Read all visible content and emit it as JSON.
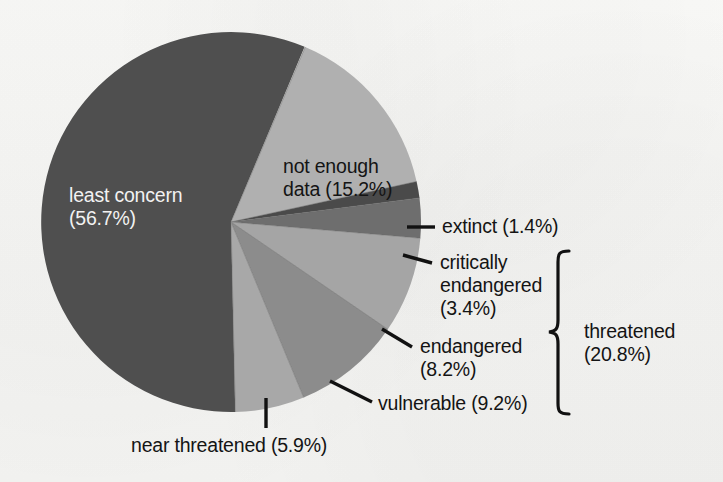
{
  "figure": {
    "background_color": "#f7f7f5",
    "text_color": "#141414",
    "light_text_color": "#f2f2f2",
    "leader_line_color": "#111111"
  },
  "pie": {
    "center_x": 231,
    "center_y": 222,
    "radius": 190,
    "start_angle_deg": 23
  },
  "labels": {
    "least_concern": "least concern\n(56.7%)",
    "not_enough_data": "not enough\ndata (15.2%)",
    "extinct": "extinct (1.4%)",
    "critically_endangered": "critically\nendangered\n(3.4%)",
    "endangered": "endangered\n(8.2%)",
    "vulnerable": "vulnerable (9.2%)",
    "near_threatened": "near threatened (5.9%)",
    "threatened_group": "threatened\n(20.8%)"
  },
  "chart_data": {
    "type": "pie",
    "title": "",
    "subtitle": "",
    "xlabel": "",
    "ylabel": "",
    "legend_position": "none",
    "grid": false,
    "units": "percent",
    "total": 100.0,
    "start_angle_deg": 23,
    "direction": "clockwise",
    "categories": [
      "not enough data",
      "extinct",
      "critically endangered",
      "endangered",
      "vulnerable",
      "near threatened",
      "least concern"
    ],
    "values": [
      15.2,
      1.4,
      3.4,
      8.2,
      9.2,
      5.9,
      56.7
    ],
    "slices": [
      {
        "name": "not enough data",
        "label": "not enough\ndata (15.2%)",
        "value": 15.2,
        "color": "#b0b0b0",
        "sweep_deg": 54.7,
        "label_inside": true
      },
      {
        "name": "extinct",
        "label": "extinct (1.4%)",
        "value": 1.4,
        "color": "#4a4a4a",
        "sweep_deg": 5.0,
        "label_inside": false
      },
      {
        "name": "critically endangered",
        "label": "critically\nendangered\n(3.4%)",
        "value": 3.4,
        "color": "#6e6e6e",
        "sweep_deg": 12.2,
        "label_inside": false
      },
      {
        "name": "endangered",
        "label": "endangered\n(8.2%)",
        "value": 8.2,
        "color": "#a5a5a5",
        "sweep_deg": 29.5,
        "label_inside": false
      },
      {
        "name": "vulnerable",
        "label": "vulnerable (9.2%)",
        "value": 9.2,
        "color": "#8c8c8c",
        "sweep_deg": 33.1,
        "label_inside": false
      },
      {
        "name": "near threatened",
        "label": "near threatened (5.9%)",
        "value": 5.9,
        "color": "#a8a8a8",
        "sweep_deg": 21.2,
        "label_inside": false
      },
      {
        "name": "least concern",
        "label": "least concern\n(56.7%)",
        "value": 56.7,
        "color": "#4f4f4f",
        "sweep_deg": 204.1,
        "label_inside": true
      }
    ],
    "groups": [
      {
        "name": "threatened",
        "label": "threatened\n(20.8%)",
        "value": 20.8,
        "members": [
          "critically endangered",
          "endangered",
          "vulnerable"
        ]
      }
    ],
    "annotations": [
      {
        "name": "threatened-bracket",
        "kind": "curly-brace",
        "text": "threatened\n(20.8%)"
      }
    ]
  }
}
